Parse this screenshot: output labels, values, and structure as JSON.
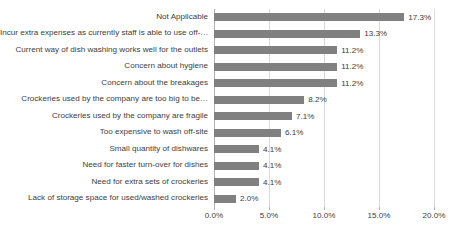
{
  "chart_data": {
    "type": "bar",
    "orientation": "horizontal",
    "title": "",
    "subtitle": "",
    "xlabel": "",
    "ylabel": "",
    "xlim": [
      0,
      20
    ],
    "xticks": [
      "0.0%",
      "5.0%",
      "10.0%",
      "15.0%",
      "20.0%"
    ],
    "xtick_values": [
      0,
      5,
      10,
      15,
      20
    ],
    "grid": true,
    "legend": false,
    "legend_position": "none",
    "categories": [
      "Not Applicable",
      "Incur extra expenses as currently staff is able to use off-…",
      "Current way of dish washing works well for the outlets",
      "Concern about hygiene",
      "Concern about the breakages",
      "Crockeries used by the company are too big to be…",
      "Crockeries used by the company are fragile",
      "Too expensive to wash off-site",
      "Small quantity of dishwares",
      "Need for faster turn-over for dishes",
      "Need for extra sets of crockeries",
      "Lack of storage space for used/washed crockeries"
    ],
    "values": [
      17.3,
      13.3,
      11.2,
      11.2,
      11.2,
      8.2,
      7.1,
      6.1,
      4.1,
      4.1,
      4.1,
      2.0
    ],
    "data_labels": [
      "17.3%",
      "13.3%",
      "11.2%",
      "11.2%",
      "11.2%",
      "8.2%",
      "7.1%",
      "6.1%",
      "4.1%",
      "4.1%",
      "4.1%",
      "2.0%"
    ],
    "series_color": "#808080",
    "gridline_color": "#D9D9D9",
    "text_color": "#404040",
    "background_color": "#FFFFFF"
  }
}
